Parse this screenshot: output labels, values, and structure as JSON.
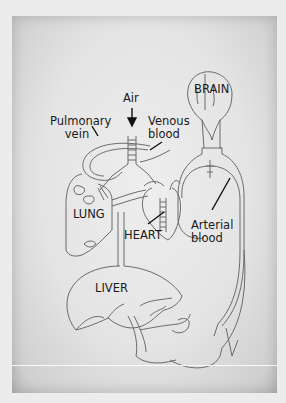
{
  "diagram": {
    "type": "anatomical-circulation-diagram",
    "labels": {
      "brain": "BRAIN",
      "air": "Air",
      "pulmonary_vein_line1": "Pulmonary",
      "pulmonary_vein_line2": "vein",
      "venous_blood_line1": "Venous",
      "venous_blood_line2": "blood",
      "lung": "LUNG",
      "heart": "HEART",
      "arterial_blood_line1": "Arterial",
      "arterial_blood_line2": "blood",
      "liver": "LIVER"
    },
    "colors": {
      "background": "#ececec",
      "paper": "#e4e4e4",
      "line": "#6a6a6a",
      "text": "#1a1a1a",
      "pointer": "#111111"
    }
  }
}
